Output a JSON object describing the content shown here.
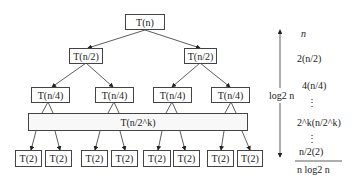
{
  "diagram": {
    "type": "recursion-tree",
    "nodes": {
      "root": "T(n)",
      "level1": [
        "T(n/2)",
        "T(n/2)"
      ],
      "level2": [
        "T(n/4)",
        "T(n/4)",
        "T(n/4)",
        "T(n/4)"
      ],
      "levelk": "T(n/2^k)",
      "leaves": [
        "T(2)",
        "T(2)",
        "T(2)",
        "T(2)",
        "T(2)",
        "T(2)",
        "T(2)",
        "T(2)"
      ]
    },
    "height_label": "log2 n",
    "level_costs": [
      "n",
      "2(n/2)",
      "4(n/4)",
      "⋮",
      "2^k(n/2^k)",
      "⋮",
      "n/2(2)"
    ],
    "total": "n log2 n"
  }
}
